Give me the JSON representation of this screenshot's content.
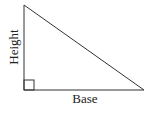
{
  "diagram": {
    "type": "right-triangle",
    "labels": {
      "height": "Height",
      "base": "Base"
    },
    "vertices": {
      "top": [
        24,
        5
      ],
      "bottom_left": [
        24,
        90
      ],
      "bottom_right": [
        144,
        90
      ]
    },
    "right_angle_marker": true,
    "colors": {
      "stroke": "#333333",
      "background": "#ffffff"
    }
  }
}
